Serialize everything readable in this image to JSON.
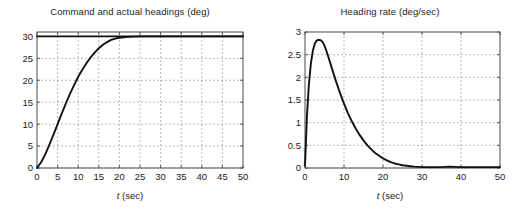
{
  "figure": {
    "width": 520,
    "height": 215,
    "background": "#ffffff",
    "line_color": "#111111",
    "grid_color": "#9a9a9a",
    "axis_color": "#4d4d4d"
  },
  "panels": [
    {
      "id": "command-and-actual-headings",
      "title": "Command and actual headings (deg)",
      "xlabel_var": "t",
      "xlabel_unit": "(sec)"
    },
    {
      "id": "heading-rate",
      "title": "Heading rate (deg/sec)",
      "xlabel_var": "t",
      "xlabel_unit": "(sec)"
    }
  ],
  "chart_data": [
    {
      "type": "line",
      "id": "command-and-actual-headings",
      "title": "Command and actual headings (deg)",
      "xlabel": "t (sec)",
      "ylabel": "",
      "xlim": [
        0,
        50
      ],
      "ylim": [
        0,
        31
      ],
      "xticks": [
        0,
        5,
        10,
        15,
        20,
        25,
        30,
        35,
        40,
        45,
        50
      ],
      "xticklabels": [
        "0",
        "5",
        "10",
        "15",
        "20",
        "25",
        "30",
        "35",
        "40",
        "45",
        "50"
      ],
      "yticks": [
        0,
        5,
        10,
        15,
        20,
        25,
        30
      ],
      "yticklabels": [
        "0",
        "5",
        "10",
        "15",
        "20",
        "25",
        "30"
      ],
      "grid": true,
      "legend": null,
      "series": [
        {
          "name": "Command heading",
          "x": [
            0,
            50
          ],
          "values": [
            30,
            30
          ]
        },
        {
          "name": "Actual heading",
          "x": [
            0,
            1,
            2,
            3,
            4,
            5,
            6,
            7,
            8,
            9,
            10,
            11,
            12,
            13,
            14,
            15,
            16,
            17,
            18,
            19,
            20,
            22,
            25,
            30,
            35,
            40,
            45,
            50
          ],
          "values": [
            0,
            1.3,
            3.1,
            5.3,
            7.6,
            10.0,
            12.4,
            14.7,
            16.9,
            18.9,
            20.8,
            22.4,
            23.9,
            25.2,
            26.3,
            27.3,
            28.1,
            28.7,
            29.2,
            29.5,
            29.7,
            29.9,
            30.0,
            30.0,
            30.0,
            30.0,
            30.0,
            30.0
          ]
        }
      ]
    },
    {
      "type": "line",
      "id": "heading-rate",
      "title": "Heading rate (deg/sec)",
      "xlabel": "t (sec)",
      "ylabel": "",
      "xlim": [
        0,
        50
      ],
      "ylim": [
        0,
        3
      ],
      "xticks": [
        0,
        10,
        20,
        30,
        40,
        50
      ],
      "xticklabels": [
        "0",
        "10",
        "20",
        "30",
        "40",
        "50"
      ],
      "yticks": [
        0,
        0.5,
        1,
        1.5,
        2,
        2.5,
        3
      ],
      "yticklabels": [
        "0",
        "0.5",
        "1",
        "1.5",
        "2",
        "2.5",
        "3"
      ],
      "grid": true,
      "legend": null,
      "series": [
        {
          "name": "Heading rate",
          "x": [
            0,
            0.5,
            1,
            1.5,
            2,
            2.5,
            3,
            3.5,
            4,
            4.5,
            5,
            5.5,
            6,
            7,
            8,
            9,
            10,
            11,
            12,
            13,
            14,
            15,
            16,
            17,
            18,
            19,
            20,
            21,
            22,
            23,
            24,
            25,
            26,
            27,
            28,
            30,
            32,
            35,
            37,
            40,
            45,
            50
          ],
          "values": [
            0.05,
            1.15,
            1.85,
            2.3,
            2.58,
            2.74,
            2.81,
            2.83,
            2.82,
            2.78,
            2.7,
            2.58,
            2.45,
            2.17,
            1.9,
            1.65,
            1.42,
            1.21,
            1.03,
            0.87,
            0.73,
            0.61,
            0.5,
            0.41,
            0.33,
            0.27,
            0.21,
            0.17,
            0.13,
            0.1,
            0.08,
            0.06,
            0.05,
            0.04,
            0.03,
            0.02,
            0.02,
            0.02,
            0.03,
            0.02,
            0.02,
            0.02
          ]
        }
      ]
    }
  ]
}
